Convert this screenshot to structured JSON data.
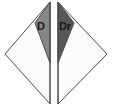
{
  "figure": {
    "background_color": "#ffffff",
    "outline_color": "#4d4d4d",
    "interior_color": "#fbfbfb",
    "width": 113,
    "height": 108,
    "shapes": [
      {
        "id": "left-half-diamond",
        "name": "left-half-diamond",
        "label": "D",
        "label_x": 37,
        "label_y": 21,
        "outline_points": "50,2 5,54 50,104",
        "shaded_points": "50,2 35,23 50,63",
        "shaded_color": "#878787",
        "interior_color": "#fbfbfb",
        "outline_color": "#4d4d4d",
        "spine_points": "50,2 50,104"
      },
      {
        "id": "right-half-diamond",
        "name": "right-half-diamond",
        "label": "Dr",
        "label_x": 59,
        "label_y": 21,
        "outline_points": "58,2 107,54 58,104",
        "shaded_points": "58,2 74,23 58,63",
        "shaded_color": "#575757",
        "interior_color": "#fbfbfb",
        "outline_color": "#4d4d4d",
        "spine_points": "58,2 58,104"
      }
    ]
  }
}
